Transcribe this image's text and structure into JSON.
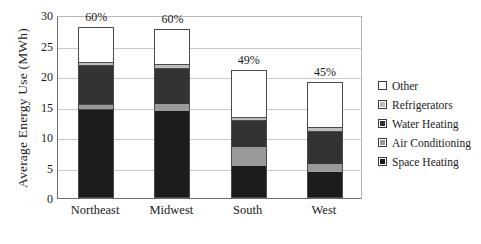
{
  "chart_data": {
    "type": "bar",
    "subtype": "stacked",
    "title": "",
    "xlabel": "",
    "ylabel": "Average Energy Use (MWh)",
    "ylim": [
      0,
      30
    ],
    "yticks": [
      0,
      5,
      10,
      15,
      20,
      25,
      30
    ],
    "ytick_labels": [
      "0",
      "5",
      "10",
      "15",
      "20",
      "25",
      "30"
    ],
    "grid": true,
    "grid_axis": "y",
    "legend_position": "right",
    "categories": [
      "Northeast",
      "Midwest",
      "South",
      "West"
    ],
    "series": [
      {
        "name": "Space Heating",
        "color": "#1c1c1c",
        "values": [
          14.4,
          14.2,
          5.2,
          4.2
        ]
      },
      {
        "name": "Air Conditioning",
        "color": "#9a9a9a",
        "values": [
          1.1,
          1.2,
          3.1,
          1.3
        ]
      },
      {
        "name": "Water Heating",
        "color": "#333333",
        "values": [
          6.2,
          5.9,
          4.4,
          5.4
        ]
      },
      {
        "name": "Refrigerators",
        "color": "#bdbdbd",
        "values": [
          0.7,
          0.7,
          0.7,
          0.7
        ]
      },
      {
        "name": "Other",
        "color": "#ffffff",
        "values": [
          5.6,
          5.7,
          7.6,
          7.4
        ]
      }
    ],
    "totals": [
      28.0,
      27.7,
      21.0,
      19.0
    ],
    "bar_labels": [
      "60%",
      "60%",
      "49%",
      "45%"
    ],
    "bar_label_note": "percent of total shown above each bar"
  },
  "axis": {
    "y_title": "Average Energy Use (MWh)"
  },
  "legend": {
    "items": [
      {
        "label": "Other",
        "color": "#ffffff"
      },
      {
        "label": "Refrigerators",
        "color": "#bdbdbd"
      },
      {
        "label": "Water Heating",
        "color": "#333333"
      },
      {
        "label": "Air Conditioning",
        "color": "#9a9a9a"
      },
      {
        "label": "Space Heating",
        "color": "#1c1c1c"
      }
    ]
  },
  "caption": {
    "text": ""
  }
}
